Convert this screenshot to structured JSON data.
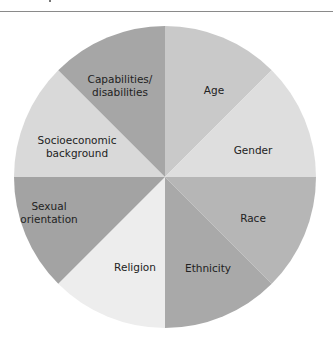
{
  "chart_data": {
    "type": "pie",
    "title": "",
    "categories": [
      "Age",
      "Gender",
      "Race",
      "Ethnicity",
      "Religion",
      "Sexual orientation",
      "Socioeconomic background",
      "Capabilities/disabilities"
    ],
    "values": [
      12.5,
      12.5,
      12.5,
      12.5,
      12.5,
      12.5,
      12.5,
      12.5
    ],
    "slices": [
      {
        "label": "Age",
        "lines": [
          "Age"
        ],
        "value": 12.5,
        "color": "#c9c9c9"
      },
      {
        "label": "Gender",
        "lines": [
          "Gender"
        ],
        "value": 12.5,
        "color": "#dedede"
      },
      {
        "label": "Race",
        "lines": [
          "Race"
        ],
        "value": 12.5,
        "color": "#b6b6b6"
      },
      {
        "label": "Ethnicity",
        "lines": [
          "Ethnicity"
        ],
        "value": 12.5,
        "color": "#a9a9a9"
      },
      {
        "label": "Religion",
        "lines": [
          "Religion"
        ],
        "value": 12.5,
        "color": "#ededed"
      },
      {
        "label": "Sexual orientation",
        "lines": [
          "Sexual",
          "orientation"
        ],
        "value": 12.5,
        "color": "#a3a3a3"
      },
      {
        "label": "Socioeconomic background",
        "lines": [
          "Socioeconomic",
          "background"
        ],
        "value": 12.5,
        "color": "#d9d9d9"
      },
      {
        "label": "Capabilities/disabilities",
        "lines": [
          "Capabilities/",
          "disabilities"
        ],
        "value": 12.5,
        "color": "#a6a6a6"
      }
    ],
    "legend": "none",
    "start_angle_deg": 0,
    "direction": "clockwise"
  }
}
